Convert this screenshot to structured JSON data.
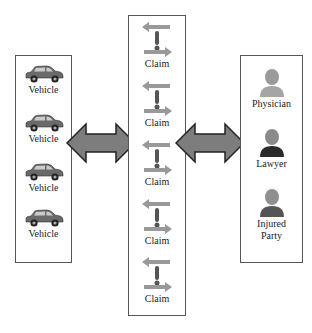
{
  "vehicles": {
    "items": [
      {
        "label": "Vehicle"
      },
      {
        "label": "Vehicle"
      },
      {
        "label": "Vehicle"
      },
      {
        "label": "Vehicle"
      }
    ]
  },
  "claims": {
    "items": [
      {
        "label": "Claim"
      },
      {
        "label": "Claim"
      },
      {
        "label": "Claim"
      },
      {
        "label": "Claim"
      },
      {
        "label": "Claim"
      }
    ]
  },
  "parties": {
    "items": [
      {
        "label": "Physician"
      },
      {
        "label": "Lawyer"
      },
      {
        "label": "Injured Party"
      }
    ]
  },
  "colors": {
    "arrow_fill": "#7d7d7d",
    "arrow_stroke": "#222222",
    "border": "#555555"
  }
}
